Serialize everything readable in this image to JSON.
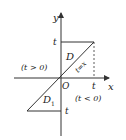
{
  "diagram": {
    "axes": {
      "x_label": "x",
      "y_label": "y",
      "origin_label": "O"
    },
    "lines": {
      "diagonal_label": "t=x",
      "top_t_label": "t",
      "x_axis_t_label": "t",
      "bottom_t_label": "t"
    },
    "regions": {
      "upper_region_label": "D",
      "upper_condition": "(t > 0)",
      "lower_region_label": "D",
      "lower_region_subscript": "1",
      "lower_condition": "(t < 0)"
    },
    "colors": {
      "stroke": "#333333",
      "background": "#ffffff"
    }
  }
}
